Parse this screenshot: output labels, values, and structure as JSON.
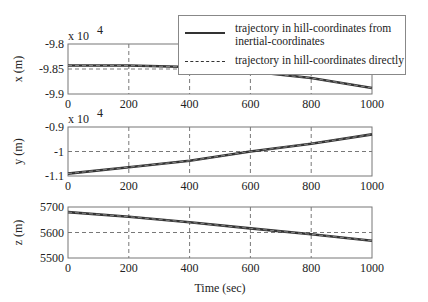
{
  "chart_data": [
    {
      "type": "line",
      "ylabel": "x (m)",
      "xlabel": "",
      "y_multiplier": "x 10^4",
      "xlim": [
        0,
        1000
      ],
      "ylim": [
        -9.9,
        -9.8
      ],
      "xticks": [
        0,
        200,
        400,
        600,
        800,
        1000
      ],
      "yticks": [
        -9.8,
        -9.85,
        -9.9
      ],
      "grid": true,
      "x": [
        0,
        200,
        400,
        600,
        800,
        1000
      ],
      "series": [
        {
          "name": "trajectory in hill-coordinates from inertial-coordinates",
          "style": "solid",
          "values": [
            -9.843,
            -9.843,
            -9.846,
            -9.855,
            -9.868,
            -9.888
          ]
        },
        {
          "name": "trajectory in hill-coordinates directly",
          "style": "dashed",
          "values": [
            -9.843,
            -9.843,
            -9.846,
            -9.855,
            -9.868,
            -9.888
          ]
        }
      ]
    },
    {
      "type": "line",
      "ylabel": "y (m)",
      "xlabel": "",
      "y_multiplier": "x 10^4",
      "xlim": [
        0,
        1000
      ],
      "ylim": [
        -1.1,
        -0.9
      ],
      "xticks": [
        0,
        200,
        400,
        600,
        800,
        1000
      ],
      "yticks": [
        -0.9,
        -1,
        -1.1
      ],
      "grid": true,
      "x": [
        0,
        200,
        400,
        600,
        800,
        1000
      ],
      "series": [
        {
          "name": "trajectory in hill-coordinates from inertial-coordinates",
          "style": "solid",
          "values": [
            -1.09,
            -1.064,
            -1.038,
            -1.0,
            -0.968,
            -0.93
          ]
        },
        {
          "name": "trajectory in hill-coordinates directly",
          "style": "dashed",
          "values": [
            -1.09,
            -1.064,
            -1.038,
            -1.0,
            -0.968,
            -0.93
          ]
        }
      ]
    },
    {
      "type": "line",
      "ylabel": "z (m)",
      "xlabel": "Time (sec)",
      "xlim": [
        0,
        1000
      ],
      "ylim": [
        5500,
        5700
      ],
      "xticks": [
        0,
        200,
        400,
        600,
        800,
        1000
      ],
      "yticks": [
        5700,
        5600,
        5500
      ],
      "grid": true,
      "x": [
        0,
        200,
        400,
        600,
        800,
        1000
      ],
      "series": [
        {
          "name": "trajectory in hill-coordinates from inertial-coordinates",
          "style": "solid",
          "values": [
            5680,
            5662,
            5640,
            5616,
            5593,
            5568
          ]
        },
        {
          "name": "trajectory in hill-coordinates directly",
          "style": "dashed",
          "values": [
            5680,
            5662,
            5640,
            5616,
            5593,
            5568
          ]
        }
      ]
    }
  ],
  "legend": {
    "items": [
      {
        "label_line1": "trajectory in hill-coordinates from",
        "label_line2": "inertial-coordinates",
        "style": "solid"
      },
      {
        "label_line1": "trajectory in hill-coordinates directly",
        "style": "dashed"
      }
    ]
  },
  "axes": {
    "p1": {
      "ylabel": "x (m)",
      "mult": "x 10",
      "exp": "4",
      "yt": [
        "-9.8",
        "-9.85",
        "-9.9"
      ]
    },
    "p2": {
      "ylabel": "y (m)",
      "mult": "x 10",
      "exp": "4",
      "yt": [
        "-0.9",
        "-1",
        "-1.1"
      ]
    },
    "p3": {
      "ylabel": "z (m)",
      "yt": [
        "5700",
        "5600",
        "5500"
      ]
    },
    "xt": [
      "0",
      "200",
      "400",
      "600",
      "800",
      "1000"
    ],
    "xlabel": "Time (sec)"
  },
  "colors": {
    "line": "#333333",
    "grid": "#555555",
    "frame": "#777777"
  }
}
